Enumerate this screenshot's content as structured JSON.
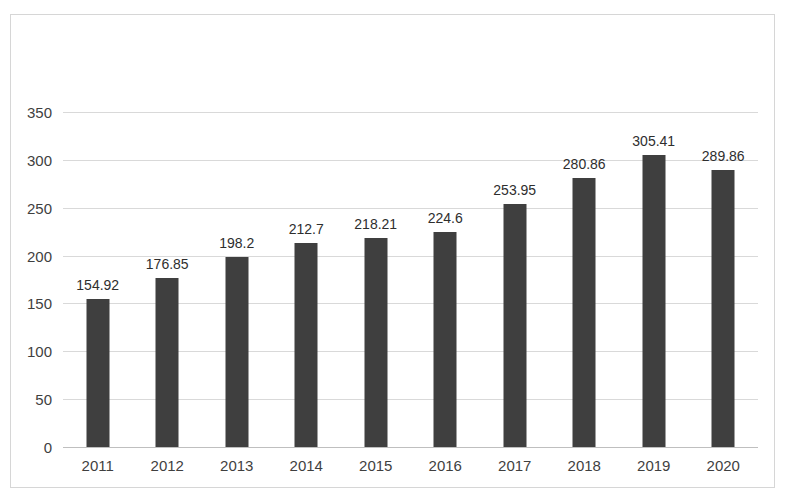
{
  "chart_data": {
    "type": "bar",
    "title": "",
    "subtitle": "",
    "xlabel": "",
    "ylabel": "",
    "categories": [
      "2011",
      "2012",
      "2013",
      "2014",
      "2015",
      "2016",
      "2017",
      "2018",
      "2019",
      "2020"
    ],
    "values": [
      154.92,
      176.85,
      198.2,
      212.7,
      218.21,
      224.6,
      253.95,
      280.86,
      305.41,
      289.86
    ],
    "value_labels": [
      "154.92",
      "176.85",
      "198.2",
      "212.7",
      "218.21",
      "224.6",
      "253.95",
      "280.86",
      "305.41",
      "289.86"
    ],
    "ylim": [
      0,
      350
    ],
    "ytick_values": [
      0,
      50,
      100,
      150,
      200,
      250,
      300,
      350
    ],
    "ytick_labels": [
      "0",
      "50",
      "100",
      "150",
      "200",
      "250",
      "300",
      "350"
    ],
    "grid": true,
    "grid_axis": "y",
    "legend": false,
    "legend_position": "none",
    "series": [
      {
        "name": "",
        "color": "#3F3F3F",
        "values": [
          154.92,
          176.85,
          198.2,
          212.7,
          218.21,
          224.6,
          253.95,
          280.86,
          305.41,
          289.86
        ]
      }
    ],
    "colors": {
      "bar": "#3F3F3F",
      "gridline": "#D9D9D9",
      "baseline": "#BFBFBF",
      "frame_border": "#D6D6D6",
      "tick_text": "#3F3F3F",
      "value_text": "#2E2E2E",
      "background": "#FFFFFF"
    }
  }
}
